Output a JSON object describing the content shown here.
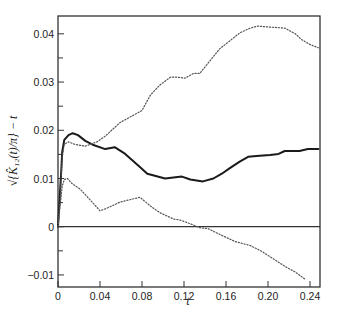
{
  "chart_data": {
    "type": "line",
    "title": "",
    "xlabel": "t",
    "ylabel": "√{K̂₁₂(t)/π} − t",
    "xlim": [
      0,
      0.2495
    ],
    "ylim": [
      -0.0125,
      0.0437
    ],
    "grid": false,
    "legend": null,
    "x_ticks": [
      0,
      0.04,
      0.08,
      0.12,
      0.16,
      0.2,
      0.24
    ],
    "x_tick_labels": [
      "0",
      "0.04",
      "0.08",
      "0.12",
      "0.16",
      "0.20",
      "0.24"
    ],
    "y_ticks": [
      -0.01,
      0,
      0.01,
      0.02,
      0.03,
      0.04
    ],
    "y_tick_labels": [
      "-0.01",
      "0",
      "0.01",
      "0.02",
      "0.03",
      "0.04"
    ],
    "y_minor_ticks": [
      -0.005,
      0.005,
      0.015,
      0.025,
      0.035
    ],
    "reference_lines": [
      {
        "orientation": "horizontal",
        "y": 0,
        "style": "solid"
      }
    ],
    "series": [
      {
        "name": "observed",
        "style": "solid",
        "x": [
          0,
          0.003,
          0.004,
          0.006,
          0.01,
          0.014,
          0.019,
          0.026,
          0.033,
          0.045,
          0.054,
          0.064,
          0.078,
          0.085,
          0.102,
          0.118,
          0.126,
          0.138,
          0.148,
          0.156,
          0.164,
          0.173,
          0.181,
          0.192,
          0.202,
          0.21,
          0.216,
          0.23,
          0.238,
          0.248
        ],
        "y": [
          0,
          0.0114,
          0.0155,
          0.018,
          0.019,
          0.0194,
          0.019,
          0.0178,
          0.017,
          0.0161,
          0.0165,
          0.0151,
          0.0124,
          0.011,
          0.01,
          0.0104,
          0.0098,
          0.0094,
          0.01,
          0.011,
          0.0122,
          0.0135,
          0.0145,
          0.0147,
          0.0149,
          0.0151,
          0.0157,
          0.0157,
          0.0161,
          0.0161
        ]
      },
      {
        "name": "upper envelope",
        "style": "dotted",
        "x": [
          0,
          0.002,
          0.003,
          0.004,
          0.006,
          0.01,
          0.016,
          0.026,
          0.037,
          0.045,
          0.059,
          0.08,
          0.088,
          0.097,
          0.107,
          0.114,
          0.121,
          0.129,
          0.135,
          0.145,
          0.154,
          0.164,
          0.173,
          0.183,
          0.19,
          0.202,
          0.216,
          0.226,
          0.232,
          0.24,
          0.248
        ],
        "y": [
          0,
          0.0053,
          0.0104,
          0.0145,
          0.0171,
          0.0176,
          0.0171,
          0.0167,
          0.0176,
          0.0188,
          0.0216,
          0.0241,
          0.0273,
          0.0294,
          0.031,
          0.031,
          0.0308,
          0.0318,
          0.0318,
          0.0345,
          0.0369,
          0.0386,
          0.0402,
          0.0412,
          0.0416,
          0.0414,
          0.0412,
          0.04,
          0.0388,
          0.0378,
          0.0371
        ]
      },
      {
        "name": "lower envelope",
        "style": "dotted",
        "x": [
          0,
          0.002,
          0.004,
          0.006,
          0.009,
          0.013,
          0.021,
          0.03,
          0.04,
          0.045,
          0.059,
          0.078,
          0.088,
          0.097,
          0.11,
          0.116,
          0.126,
          0.135,
          0.143,
          0.154,
          0.169,
          0.183,
          0.194,
          0.204,
          0.216,
          0.226,
          0.236
        ],
        "y": [
          0,
          0.0043,
          0.0084,
          0.0098,
          0.01,
          0.009,
          0.0078,
          0.0057,
          0.0033,
          0.0037,
          0.0051,
          0.0061,
          0.0043,
          0.0029,
          0.0016,
          0.0014,
          0.0006,
          -0.0002,
          -0.0004,
          -0.0016,
          -0.0031,
          -0.0039,
          -0.0051,
          -0.0065,
          -0.0082,
          -0.0094,
          -0.011
        ]
      }
    ]
  },
  "colors": {
    "axes": "#333333",
    "series_solid": "#1a1a1a",
    "series_dotted": "#555555"
  }
}
